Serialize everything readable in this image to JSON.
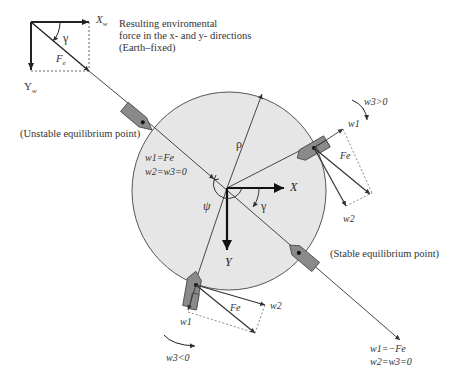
{
  "diagram": {
    "type": "vessel environmental force equilibrium diagram",
    "colors": {
      "disk_fill": "#e6e6e6",
      "disk_stroke": "#555555",
      "vessel_fill": "#8a8a8a",
      "vessel_stroke": "#444444",
      "line": "#333333"
    },
    "earth_frame": {
      "x_axis_label": "X",
      "x_axis_sub": "w",
      "y_axis_label": "Y",
      "y_axis_sub": "w",
      "angle_label": "γ",
      "force_label": "F",
      "force_sub": "e",
      "caption_lines": [
        "Resulting enviromental",
        "force in the x- and y- directions",
        "(Earth–fixed)"
      ]
    },
    "body_frame": {
      "x_label": "X",
      "y_label": "Y",
      "heading_label": "ψ",
      "gamma_label": "γ",
      "radius_label": "ρ"
    },
    "unstable_point": {
      "title": "(Unstable equilibrium point)",
      "eq1": "w1=Fe",
      "eq2": "w2=w3=0"
    },
    "stable_point": {
      "title": "(Stable equilibrium point)",
      "eq1": "w1=−Fe",
      "eq2": "w2=w3=0"
    },
    "right_vessel": {
      "w1": "w1",
      "w2": "w2",
      "force": "Fe",
      "moment": "w3>0"
    },
    "bottom_vessel": {
      "w1": "w1",
      "w2": "w2",
      "force": "Fe",
      "moment": "w3<0"
    }
  }
}
